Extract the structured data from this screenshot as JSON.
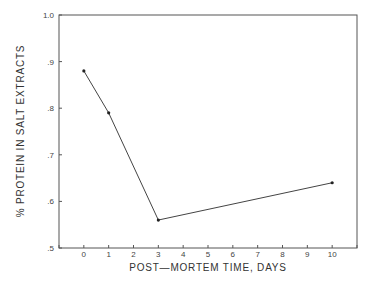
{
  "chart_data": {
    "type": "line",
    "title": "",
    "xlabel": "POST—MORTEM TIME, DAYS",
    "ylabel": "% PROTEIN IN SALT EXTRACTS",
    "x": [
      0,
      1,
      3,
      10
    ],
    "series": [
      {
        "name": "protein",
        "values": [
          0.88,
          0.79,
          0.56,
          0.64
        ]
      }
    ],
    "xlim": [
      -1,
      11
    ],
    "ylim": [
      0.5,
      1.0
    ],
    "xticks": [
      "0",
      "1",
      "2",
      "3",
      "4",
      "5",
      "6",
      "7",
      "8",
      "9",
      "10"
    ],
    "yticks": [
      ".5",
      ".6",
      ".7",
      ".8",
      ".9",
      "1.0"
    ],
    "grid": false,
    "legend": null
  }
}
